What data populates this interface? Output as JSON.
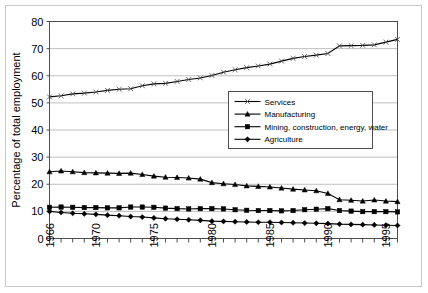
{
  "chart_data": {
    "type": "line",
    "title": "",
    "xlabel": "",
    "ylabel": "Percentage of total employment",
    "xlim": [
      1966,
      1996
    ],
    "ylim": [
      0,
      80
    ],
    "yticks": [
      0,
      10,
      20,
      30,
      40,
      50,
      60,
      70,
      80
    ],
    "xtick_labels": [
      "1966",
      "1970",
      "1975",
      "1980",
      "1985",
      "1990",
      "1995"
    ],
    "xtick_values": [
      1966,
      1970,
      1975,
      1980,
      1985,
      1990,
      1995
    ],
    "grid": "horizontal",
    "legend_position": "center",
    "x": [
      1966,
      1967,
      1968,
      1969,
      1970,
      1971,
      1972,
      1973,
      1974,
      1975,
      1976,
      1977,
      1978,
      1979,
      1980,
      1981,
      1982,
      1983,
      1984,
      1985,
      1986,
      1987,
      1988,
      1989,
      1990,
      1991,
      1992,
      1993,
      1994,
      1995,
      1996
    ],
    "series": [
      {
        "name": "Services",
        "marker": "x",
        "color": "#000000",
        "values": [
          52.2,
          52.6,
          53.3,
          53.6,
          54.0,
          54.6,
          55.0,
          55.2,
          56.3,
          57.0,
          57.2,
          57.9,
          58.6,
          59.2,
          60.1,
          61.3,
          62.2,
          63.0,
          63.6,
          64.3,
          65.4,
          66.4,
          67.1,
          67.6,
          68.2,
          71.0,
          71.1,
          71.2,
          71.4,
          72.4,
          73.4
        ]
      },
      {
        "name": "Manufacturing",
        "marker": "triangle",
        "color": "#000000",
        "values": [
          24.6,
          24.9,
          24.6,
          24.3,
          24.2,
          24.1,
          24.0,
          24.1,
          23.6,
          23.0,
          22.6,
          22.5,
          22.3,
          21.9,
          20.6,
          20.2,
          19.9,
          19.4,
          19.2,
          19.0,
          18.6,
          18.2,
          17.9,
          17.6,
          16.6,
          14.3,
          14.1,
          13.8,
          14.2,
          13.8,
          13.6
        ]
      },
      {
        "name": "Mining, construction, energy, water",
        "marker": "square",
        "color": "#000000",
        "values": [
          11.5,
          11.6,
          11.5,
          11.4,
          11.4,
          11.3,
          11.3,
          11.6,
          11.6,
          11.5,
          11.2,
          11.0,
          10.9,
          11.0,
          11.0,
          10.9,
          10.6,
          10.4,
          10.3,
          10.3,
          10.2,
          10.3,
          10.6,
          10.8,
          11.0,
          10.3,
          10.1,
          9.9,
          9.9,
          9.9,
          9.8
        ]
      },
      {
        "name": "Agriculture",
        "marker": "diamond",
        "color": "#000000",
        "values": [
          10.0,
          9.6,
          9.3,
          9.1,
          8.9,
          8.6,
          8.4,
          8.1,
          7.9,
          7.6,
          7.3,
          7.1,
          6.9,
          6.7,
          6.4,
          6.3,
          6.2,
          6.1,
          6.0,
          6.0,
          5.9,
          5.8,
          5.7,
          5.6,
          5.5,
          5.3,
          5.2,
          5.1,
          5.0,
          4.9,
          4.8
        ]
      }
    ]
  }
}
